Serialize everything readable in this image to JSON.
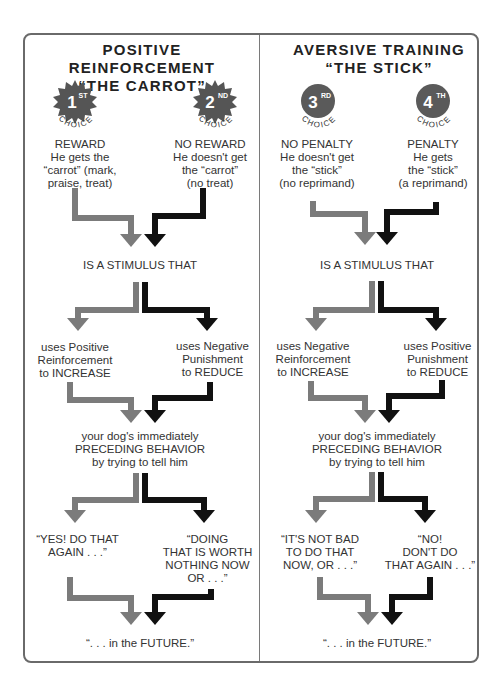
{
  "left": {
    "title_line1": "POSITIVE REINFORCEMENT",
    "title_line2": "“THE CARROT”",
    "choices": [
      {
        "rank": "1",
        "suffix": "ST",
        "word": "CHOICE",
        "shape": "starburst",
        "heading": "REWARD",
        "lines": [
          "He gets the",
          "“carrot” (mark,",
          "praise, treat)"
        ]
      },
      {
        "rank": "2",
        "suffix": "ND",
        "word": "CHOICE",
        "shape": "starburst",
        "heading": "NO REWARD",
        "lines": [
          "He doesn't get",
          "the “carrot”",
          "(no treat)"
        ]
      }
    ],
    "stimulus": "IS A STIMULUS THAT",
    "branches": [
      {
        "lines": [
          "uses Positive",
          "Reinforcement",
          "to INCREASE"
        ]
      },
      {
        "lines": [
          "uses Negative",
          "Punishment",
          "to REDUCE"
        ]
      }
    ],
    "behavior": [
      "your dog's immediately",
      "PRECEDING BEHAVIOR",
      "by trying to tell him"
    ],
    "messages": [
      {
        "lines": [
          "“YES! DO THAT",
          "AGAIN . . .”"
        ]
      },
      {
        "lines": [
          "“DOING",
          "THAT IS WORTH",
          "NOTHING NOW",
          "OR . . .”"
        ]
      }
    ],
    "future": "“. . . in the  FUTURE.”"
  },
  "right": {
    "title_line1": "AVERSIVE TRAINING",
    "title_line2": "“THE STICK”",
    "choices": [
      {
        "rank": "3",
        "suffix": "RD",
        "word": "CHOICE",
        "shape": "circle",
        "heading": "NO PENALTY",
        "lines": [
          "He doesn't get",
          "the “stick”",
          "(no reprimand)"
        ]
      },
      {
        "rank": "4",
        "suffix": "TH",
        "word": "CHOICE",
        "shape": "circle",
        "heading": "PENALTY",
        "lines": [
          "He gets",
          "the “stick”",
          "(a reprimand)"
        ]
      }
    ],
    "stimulus": "IS A STIMULUS THAT",
    "branches": [
      {
        "lines": [
          "uses Negative",
          "Reinforcement",
          "to INCREASE"
        ]
      },
      {
        "lines": [
          "uses Positive",
          "Punishment",
          "to REDUCE"
        ]
      }
    ],
    "behavior": [
      "your dog's immediately",
      "PRECEDING BEHAVIOR",
      "by trying to tell him"
    ],
    "messages": [
      {
        "lines": [
          "“IT'S NOT BAD",
          "TO DO THAT",
          "NOW, OR . . .”"
        ]
      },
      {
        "lines": [
          "“NO!",
          "DON'T DO",
          "THAT AGAIN . . .”"
        ]
      }
    ],
    "future": "“. . . in the  FUTURE.”"
  },
  "colors": {
    "gray_arrow": "#7b7b7b",
    "black_arrow": "#111111",
    "badge_fill": "#5a5a5a",
    "frame": "#6a6a6a"
  }
}
